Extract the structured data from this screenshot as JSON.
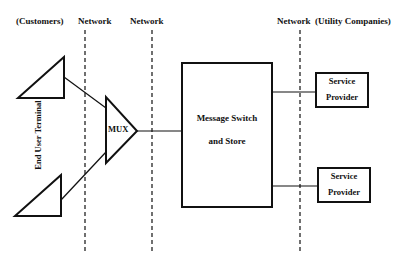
{
  "header": {
    "customers": "(Customers)",
    "network1": "Network",
    "network2": "Network",
    "network3": "Network",
    "utility": "(Utility Companies)"
  },
  "nodes": {
    "end_user_terminal": "End User Terminal",
    "mux": "MUX",
    "message_switch_line1": "Message Switch",
    "message_switch_line2": "and Store",
    "service_provider_1_line1": "Service",
    "service_provider_1_line2": "Provider",
    "service_provider_2_line1": "Service",
    "service_provider_2_line2": "Provider"
  },
  "colors": {
    "stroke": "#111111",
    "background": "#ffffff"
  }
}
